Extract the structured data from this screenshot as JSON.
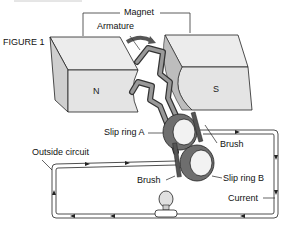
{
  "figure": {
    "label": "FIGURE 1"
  },
  "labels": {
    "magnet": "Magnet",
    "armature": "Armature",
    "north_pole": "N",
    "south_pole": "S",
    "slip_ring_a": "Slip ring A",
    "slip_ring_b": "Slip ring B",
    "brush_upper": "Brush",
    "brush_lower": "Brush",
    "outside_circuit": "Outside circuit",
    "current": "Current"
  },
  "colors": {
    "magnet_face": "#e6e6e6",
    "magnet_side": "#cfcfcf",
    "armature": "#8a8a8a",
    "slip_ring": "#6e6e6e",
    "wire": "#222222",
    "bulb": "#d9d9d9"
  }
}
